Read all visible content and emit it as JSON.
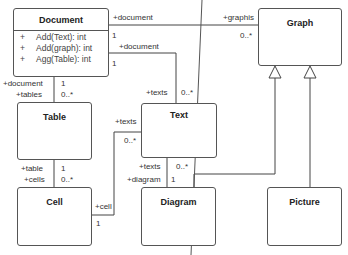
{
  "diagram": {
    "type": "UML class diagram",
    "classes": {
      "document": {
        "name": "Document",
        "operations": [
          {
            "visibility": "+",
            "signature": "Add(Text): int"
          },
          {
            "visibility": "+",
            "signature": "Add(graph): int"
          },
          {
            "visibility": "+",
            "signature": "Agg(Table): int"
          }
        ]
      },
      "graph": {
        "name": "Graph"
      },
      "table": {
        "name": "Table"
      },
      "text": {
        "name": "Text"
      },
      "cell": {
        "name": "Cell"
      },
      "diagram": {
        "name": "Diagram"
      },
      "picture": {
        "name": "Picture"
      }
    },
    "associations": {
      "document_graph": {
        "role_document": "+document",
        "mult_document": "1",
        "role_graph": "+graphis",
        "mult_graph": "0..*"
      },
      "document_text": {
        "role_document": "+document",
        "mult_document": "1",
        "role_text": "+texts",
        "mult_text": "0..*"
      },
      "document_table": {
        "role_document": "+document",
        "mult_document": "1",
        "role_table": "+tables",
        "mult_table": "0..*"
      },
      "table_cell": {
        "role_table": "+table",
        "mult_table": "1",
        "role_cell": "+cells",
        "mult_cell": "0..*"
      },
      "cell_text": {
        "role_cell": "+cell",
        "mult_cell": "1",
        "role_text": "+texts",
        "mult_text": "0..*"
      },
      "text_diagram": {
        "role_text": "+texts",
        "mult_text": "0..*",
        "role_diagram": "+diagram",
        "mult_diagram": "1"
      }
    },
    "generalizations": [
      {
        "child": "Diagram",
        "parent": "Graph"
      },
      {
        "child": "Picture",
        "parent": "Graph"
      }
    ]
  }
}
